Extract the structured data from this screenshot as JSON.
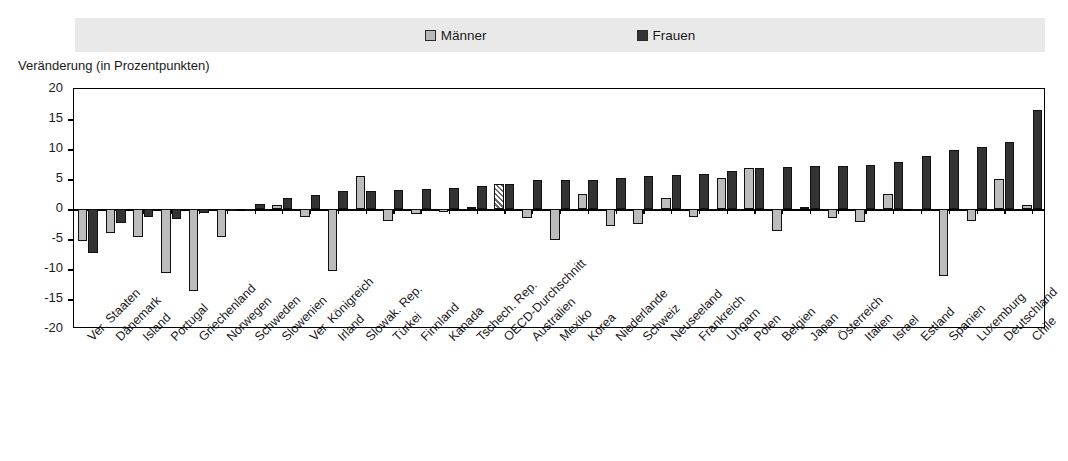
{
  "legend": {
    "maenner": "Männer",
    "frauen": "Frauen",
    "maenner_color": "#bcbcbc",
    "frauen_color": "#333333",
    "band_color": "#e9e9e9"
  },
  "axis": {
    "y_title": "Veränderung (in Prozentpunkten)",
    "y_ticks": [
      "20",
      "15",
      "10",
      "5",
      "0",
      "-5",
      "-10",
      "-15",
      "-20"
    ]
  },
  "chart_data": {
    "type": "bar",
    "title": "Veränderung (in Prozentpunkten)",
    "xlabel": "",
    "ylabel": "Veränderung (in Prozentpunkten)",
    "ylim": [
      -20,
      20
    ],
    "ytick_step": 5,
    "grid": false,
    "legend_position": "top-center",
    "highlight_category": "OECD-Durchschnitt",
    "highlight_style": "hatched",
    "categories": [
      "Ver. Staaten",
      "Dänemark",
      "Island",
      "Portugal",
      "Griechenland",
      "Norwegen",
      "Schweden",
      "Slowenien",
      "Ver. Königreich",
      "Irland",
      "Slowak. Rep.",
      "Türkei",
      "Finnland",
      "Kanada",
      "Tschech. Rep.",
      "OECD-Durchschnitt",
      "Australien",
      "Mexiko",
      "Korea",
      "Niederlande",
      "Schweiz",
      "Neuseeland",
      "Frankreich",
      "Ungarn",
      "Polen",
      "Belgien",
      "Japan",
      "Österreich",
      "Italien",
      "Israel",
      "Estland",
      "Spanien",
      "Luxemburg",
      "Deutschland",
      "Chile"
    ],
    "series": [
      {
        "name": "Männer",
        "color": "#bcbcbc",
        "values": [
          -5.3,
          -4.0,
          -4.7,
          -10.7,
          -13.7,
          -4.7,
          -0.3,
          0.7,
          -1.3,
          -10.3,
          5.5,
          -2.0,
          -0.8,
          -0.5,
          0.4,
          4.2,
          -1.5,
          -5.2,
          2.5,
          -2.8,
          -2.5,
          1.8,
          -1.3,
          5.2,
          6.9,
          -3.7,
          0.4,
          -1.5,
          -2.2,
          2.5,
          -0.2,
          -11.2,
          -2.0,
          5.0,
          0.6
        ]
      },
      {
        "name": "Frauen",
        "color": "#333333",
        "values": [
          -7.3,
          -2.3,
          -1.3,
          -1.7,
          -0.7,
          -0.3,
          0.8,
          1.8,
          2.3,
          3.0,
          3.0,
          3.2,
          3.3,
          3.5,
          3.8,
          4.2,
          4.8,
          4.8,
          4.8,
          5.2,
          5.5,
          5.7,
          5.8,
          6.3,
          6.9,
          7.0,
          7.1,
          7.2,
          7.4,
          7.8,
          8.8,
          9.8,
          10.3,
          11.2,
          16.5
        ]
      }
    ]
  }
}
